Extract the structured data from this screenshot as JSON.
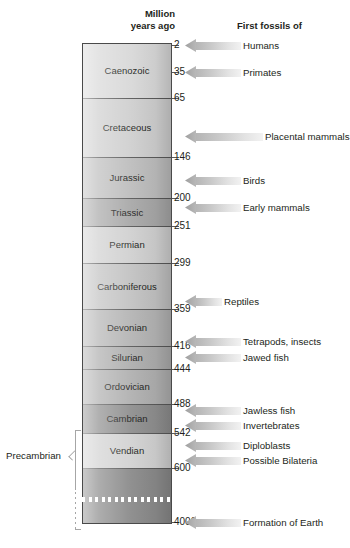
{
  "chart_data": {
    "type": "table",
    "headers": {
      "scale": "Million\nyears ago",
      "fossils": "First fossils of"
    },
    "axis_label": "Million years ago",
    "axis_unit": "Ma",
    "axis_direction": "top = present, bottom = past",
    "supereon_label": "Precambrian",
    "supereon_range_mya": [
      542,
      4000
    ],
    "periods": [
      {
        "name": "Caenozoic",
        "start_mya": 65,
        "end_mya": 0,
        "top_px": 43,
        "bottom_px": 98,
        "shade": "#d8d8d8"
      },
      {
        "name": "Cretaceous",
        "start_mya": 146,
        "end_mya": 65,
        "top_px": 98,
        "bottom_px": 157,
        "shade": "#cfcfcf"
      },
      {
        "name": "Jurassic",
        "start_mya": 200,
        "end_mya": 146,
        "top_px": 157,
        "bottom_px": 198,
        "shade": "#bdbdbd"
      },
      {
        "name": "Triassic",
        "start_mya": 251,
        "end_mya": 200,
        "top_px": 198,
        "bottom_px": 226,
        "shade": "#a8a8a8"
      },
      {
        "name": "Permian",
        "start_mya": 299,
        "end_mya": 251,
        "top_px": 226,
        "bottom_px": 263,
        "shade": "#d0d0d0"
      },
      {
        "name": "Carboniferous",
        "start_mya": 359,
        "end_mya": 299,
        "top_px": 263,
        "bottom_px": 309,
        "shade": "#c2c2c2"
      },
      {
        "name": "Devonian",
        "start_mya": 416,
        "end_mya": 359,
        "top_px": 309,
        "bottom_px": 346,
        "shade": "#b4b4b4"
      },
      {
        "name": "Silurian",
        "start_mya": 444,
        "end_mya": 416,
        "top_px": 346,
        "bottom_px": 369,
        "shade": "#aeaeae"
      },
      {
        "name": "Ordovician",
        "start_mya": 488,
        "end_mya": 444,
        "top_px": 369,
        "bottom_px": 404,
        "shade": "#b0b0b0"
      },
      {
        "name": "Cambrian",
        "start_mya": 542,
        "end_mya": 488,
        "top_px": 404,
        "bottom_px": 433,
        "shade": "#8f8f8f"
      },
      {
        "name": "Vendian",
        "start_mya": 600,
        "end_mya": 542,
        "top_px": 433,
        "bottom_px": 468,
        "shade": "#d2d2d2"
      },
      {
        "name": "",
        "start_mya": 4000,
        "end_mya": 600,
        "top_px": 468,
        "bottom_px": 524,
        "shade": "#8a8a8a"
      }
    ],
    "ticks": [
      {
        "value": "2",
        "y_px": 45
      },
      {
        "value": "35",
        "y_px": 72
      },
      {
        "value": "65",
        "y_px": 98
      },
      {
        "value": "146",
        "y_px": 157
      },
      {
        "value": "200",
        "y_px": 198
      },
      {
        "value": "251",
        "y_px": 226
      },
      {
        "value": "299",
        "y_px": 263
      },
      {
        "value": "359",
        "y_px": 309
      },
      {
        "value": "416",
        "y_px": 346
      },
      {
        "value": "444",
        "y_px": 369
      },
      {
        "value": "488",
        "y_px": 404
      },
      {
        "value": "542",
        "y_px": 433
      },
      {
        "value": "600",
        "y_px": 468
      },
      {
        "value": "4000",
        "y_px": 522
      }
    ],
    "events": [
      {
        "label": "Humans",
        "mya": 2,
        "y_px": 45,
        "arrow_width_px": 56,
        "label_x_px": 240
      },
      {
        "label": "Primates",
        "mya": 35,
        "y_px": 72,
        "arrow_width_px": 56,
        "label_x_px": 240
      },
      {
        "label": "Placental mammals",
        "mya": 130,
        "y_px": 136,
        "arrow_width_px": 78,
        "label_x_px": 240
      },
      {
        "label": "Birds",
        "mya": 180,
        "y_px": 180,
        "arrow_width_px": 56,
        "label_x_px": 240
      },
      {
        "label": "Early mammals",
        "mya": 220,
        "y_px": 207,
        "arrow_width_px": 56,
        "label_x_px": 240
      },
      {
        "label": "Reptiles",
        "mya": 359,
        "y_px": 301,
        "arrow_width_px": 37,
        "label_x_px": 219
      },
      {
        "label": "Tetrapods, insects",
        "mya": 416,
        "y_px": 341,
        "arrow_width_px": 56,
        "label_x_px": 240
      },
      {
        "label": "Jawed fish",
        "mya": 444,
        "y_px": 357,
        "arrow_width_px": 56,
        "label_x_px": 240
      },
      {
        "label": "Jawless fish",
        "mya": 500,
        "y_px": 410,
        "arrow_width_px": 56,
        "label_x_px": 240
      },
      {
        "label": "Invertebrates",
        "mya": 530,
        "y_px": 425,
        "arrow_width_px": 56,
        "label_x_px": 240
      },
      {
        "label": "Diploblasts",
        "mya": 570,
        "y_px": 445,
        "arrow_width_px": 56,
        "label_x_px": 240
      },
      {
        "label": "Possible Bilateria",
        "mya": 590,
        "y_px": 460,
        "arrow_width_px": 56,
        "label_x_px": 240
      },
      {
        "label": "Formation of Earth",
        "mya": 4000,
        "y_px": 522,
        "arrow_width_px": 56,
        "label_x_px": 240
      }
    ],
    "colors": {
      "text": "#231f20",
      "column_border": "#4a4a4a",
      "band_rule": "#5a5a5a",
      "arrow_head": "#9f9f9f",
      "arrow_tail": "#f2f2f2",
      "bracket": "#a6a6a6"
    },
    "grid": false,
    "legend": "none"
  }
}
